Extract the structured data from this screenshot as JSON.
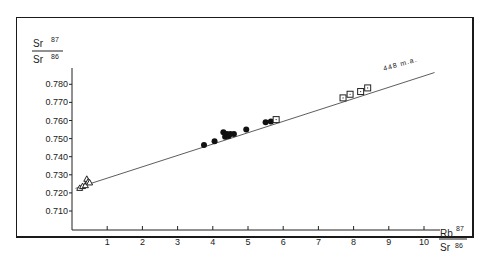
{
  "chart_data": {
    "type": "scatter",
    "title": "",
    "ylabel": "Sr87/Sr86",
    "ylabel_parts": {
      "num": "Sr",
      "num_sup": "87",
      "den": "Sr",
      "den_sup": "86"
    },
    "xlabel": "Rb87/Sr86",
    "xlabel_parts": {
      "num": "Rb",
      "num_sup": "87",
      "den": "Sr",
      "den_sup": "86"
    },
    "xlim": [
      0,
      10.5
    ],
    "ylim": [
      0.7,
      0.785
    ],
    "x_ticks": [
      "1",
      "2",
      "3",
      "4",
      "5",
      "6",
      "7",
      "8",
      "9",
      "10"
    ],
    "y_ticks": [
      "0.710",
      "0.720",
      "0.730",
      "0.740",
      "0.750",
      "0.760",
      "0.770",
      "0.780"
    ],
    "grid": false,
    "annotation": "448 m.a.",
    "isochron": {
      "x": [
        0.1,
        10.3
      ],
      "y": [
        0.7225,
        0.7865
      ],
      "label": "448 m.a."
    },
    "series": [
      {
        "name": "triangles",
        "marker": "triangle",
        "x": [
          0.22,
          0.3,
          0.38,
          0.42,
          0.46,
          0.5
        ],
        "y": [
          0.7225,
          0.7235,
          0.724,
          0.7275,
          0.726,
          0.7255
        ]
      },
      {
        "name": "circles",
        "marker": "circle",
        "x": [
          3.75,
          4.05,
          4.3,
          4.35,
          4.4,
          4.45,
          4.5,
          4.6,
          4.95,
          5.5,
          5.65
        ],
        "y": [
          0.7465,
          0.7485,
          0.7535,
          0.751,
          0.7525,
          0.7515,
          0.7525,
          0.7525,
          0.755,
          0.759,
          0.7595
        ]
      },
      {
        "name": "squares",
        "marker": "square",
        "x": [
          5.8,
          7.7,
          7.9,
          8.2,
          8.4
        ],
        "y": [
          0.7605,
          0.7725,
          0.7745,
          0.776,
          0.778
        ]
      }
    ]
  }
}
